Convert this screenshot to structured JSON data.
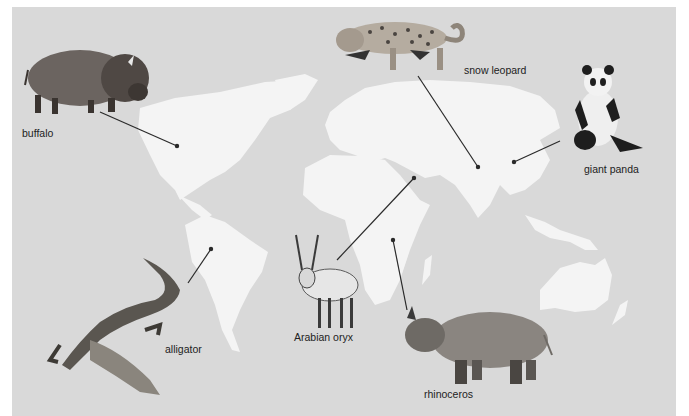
{
  "figure": {
    "colors": {
      "background": "#ffffff",
      "ocean": "#d9d9d9",
      "land": "#f4f4f4",
      "line": "#2a2a2a",
      "label": "#222222"
    }
  },
  "animals": [
    {
      "name": "buffalo",
      "label": "buffalo",
      "label_pos": [
        22,
        127
      ],
      "line": [
        [
          100,
          112
        ],
        [
          177,
          146
        ]
      ]
    },
    {
      "name": "snow-leopard",
      "label": "snow leopard",
      "label_pos": [
        464,
        64
      ],
      "line": [
        [
          418,
          76
        ],
        [
          478,
          167
        ]
      ]
    },
    {
      "name": "giant-panda",
      "label": "giant panda",
      "label_pos": [
        584,
        163
      ],
      "line": [
        [
          560,
          141
        ],
        [
          514,
          162
        ]
      ]
    },
    {
      "name": "arabian-oryx",
      "label": "Arabian oryx",
      "label_pos": [
        294,
        331
      ],
      "line": [
        [
          337,
          260
        ],
        [
          414,
          178
        ]
      ]
    },
    {
      "name": "alligator",
      "label": "alligator",
      "label_pos": [
        165,
        343
      ],
      "line": [
        [
          188,
          283
        ],
        [
          211,
          249
        ]
      ]
    },
    {
      "name": "rhinoceros",
      "label": "rhinoceros",
      "label_pos": [
        424,
        388
      ],
      "line": [
        [
          407,
          310
        ],
        [
          393,
          240
        ]
      ]
    }
  ]
}
